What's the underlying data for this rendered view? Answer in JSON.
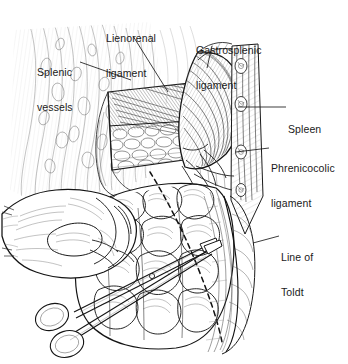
{
  "figure": {
    "background_color": "#ffffff",
    "ink_color": "#1a1a1a",
    "width": 348,
    "height": 364
  },
  "labels": [
    {
      "id": "splenic-vessels",
      "text": "Splenic\nvessels",
      "line1": "Splenic",
      "line2": "vessels",
      "x": 37,
      "y": 44,
      "leader": {
        "x1": 80,
        "x2": 131,
        "y1": 62,
        "y2": 80
      }
    },
    {
      "id": "lienorenal-ligament",
      "text": "Lienorenal\nligament",
      "line1": "Lienorenal",
      "line2": "ligament",
      "x": 106,
      "y": 10,
      "leader": {
        "x1": 133,
        "x2": 168,
        "y1": 36,
        "y2": 92
      }
    },
    {
      "id": "gastrosplenic-ligament",
      "text": "Gastrosplenic\nligament",
      "line1": "Gastrosplenic",
      "line2": "ligament",
      "x": 196,
      "y": 22,
      "leader": {
        "x1": 212,
        "x2": 208,
        "y1": 46,
        "y2": 68
      }
    },
    {
      "id": "spleen",
      "text": "Spleen",
      "line1": "Spleen",
      "line2": "",
      "x": 288,
      "y": 101,
      "leader": {
        "x1": 268,
        "x2": 238,
        "y1": 107,
        "y2": 107
      }
    },
    {
      "id": "phrenicocolic-ligament",
      "text": "Phrenicocolic\nligament",
      "line1": "Phrenicocolic",
      "line2": "ligament",
      "x": 271,
      "y": 140,
      "leader": {
        "x1": 265,
        "x2": 236,
        "y1": 148,
        "y2": 152
      }
    },
    {
      "id": "line-of-toldt",
      "text": "Line of\nToldt",
      "line1": "Line of",
      "line2": "Toldt",
      "x": 281,
      "y": 229,
      "leader": {
        "x1": 277,
        "x2": 253,
        "y1": 236,
        "y2": 243
      }
    }
  ],
  "anatomy": {
    "structures": [
      "splenic vessels",
      "lienorenal ligament",
      "gastrosplenic ligament",
      "spleen",
      "phrenicocolic ligament",
      "line of Toldt",
      "splenic flexure of colon",
      "descending colon",
      "retroperitoneal fat",
      "surgeon's hand",
      "surgical scissors"
    ],
    "style": "black-and-white pen-and-ink medical line drawing with cross-hatching"
  }
}
